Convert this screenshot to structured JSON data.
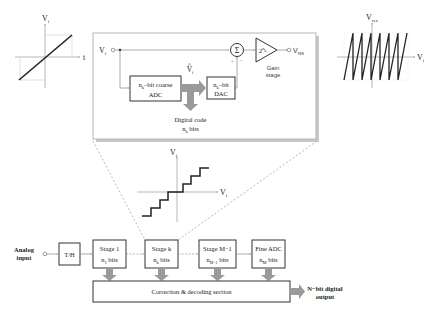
{
  "input_waveform": {
    "y_axis_label": "V",
    "y_axis_sub": "i",
    "x_axis_label": "t"
  },
  "stage_detail": {
    "input_label": "V",
    "input_sub": "i",
    "coarse_adc": {
      "line1_prefix": "n",
      "line1_sub": "k",
      "line1_suffix": "–bit coarse",
      "line2": "ADC"
    },
    "dac": {
      "line1_prefix": "n",
      "line1_sub": "k",
      "line1_suffix": "–bit",
      "line2": "DAC"
    },
    "estimate_label": "V",
    "estimate_sub": "i",
    "summer_symbol": "Σ",
    "summer_plus": "+",
    "summer_minus": "−",
    "gain_base": "2",
    "gain_exp": "n",
    "gain_exp_sub": "k",
    "gain_label_line1": "Gain",
    "gain_label_line2": "stage",
    "output_label": "V",
    "output_sub": "res",
    "digital_code_line1": "Digital code",
    "digital_code_line2_prefix": "n",
    "digital_code_line2_sub": "k",
    "digital_code_line2_suffix": " bits"
  },
  "residue_waveform": {
    "y_axis_label": "V",
    "y_axis_sub": "res",
    "x_axis_label": "V",
    "x_axis_sub": "i",
    "teeth": 7
  },
  "quantizer_transfer": {
    "y_axis_label": "V",
    "y_axis_sub": "i",
    "x_axis_label": "V",
    "x_axis_sub": "i"
  },
  "pipeline": {
    "input_label_line1": "Analog",
    "input_label_line2": "input",
    "th_label": "T/H",
    "stages": [
      {
        "title": "Stage 1",
        "bits_prefix": "n",
        "bits_sub": "1",
        "bits_suffix": " bits"
      },
      {
        "title": "Stage  k",
        "bits_prefix": "n",
        "bits_sub": "k",
        "bits_suffix": " bits"
      },
      {
        "title": "Stage  M−1",
        "bits_prefix": "n",
        "bits_sub": "M−1",
        "bits_suffix": " bits"
      },
      {
        "title": "Fine ADC",
        "bits_prefix": "n",
        "bits_sub": "M",
        "bits_suffix": " bits"
      }
    ],
    "correction_label": "Correction & decoding section",
    "output_label_line1": "N−bit digital",
    "output_label_line2": "output"
  },
  "colors": {
    "line": "#222222",
    "thin_line": "#888888",
    "fat_arrow": "#9a9a9a",
    "panel_border": "#b5b5b5",
    "panel_shadow": "#c8c8c8",
    "dashed": "#9a9a9a"
  }
}
